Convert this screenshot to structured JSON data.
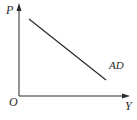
{
  "diagram": {
    "type": "aggregate-demand-curve",
    "axes": {
      "y_label": "P",
      "x_label": "Y",
      "origin_label": "O"
    },
    "curves": [
      {
        "label": "AD",
        "shape": "downward-sloping straight line"
      }
    ],
    "colors": {
      "line": "#2a2a2a",
      "background": "#ffffff"
    }
  }
}
